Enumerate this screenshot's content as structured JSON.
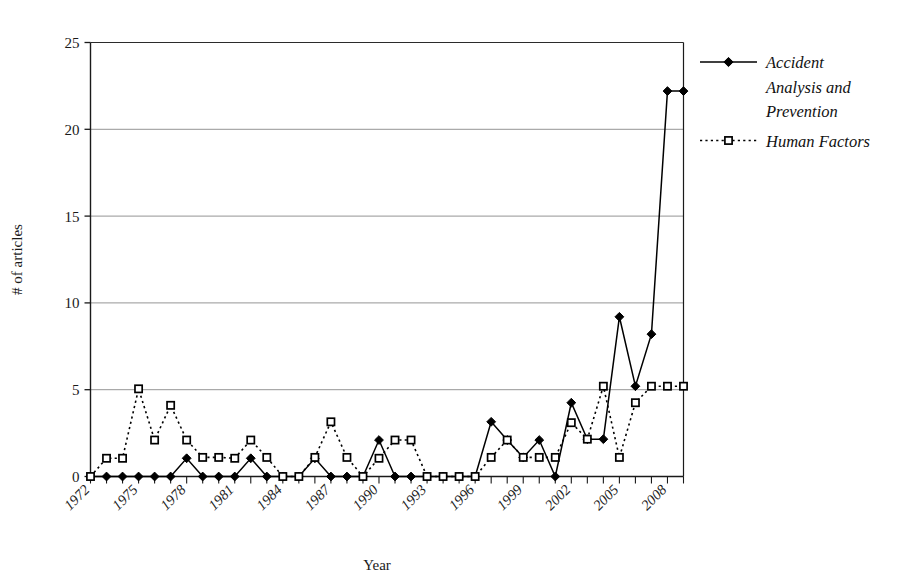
{
  "chart_data": {
    "type": "line",
    "title": "",
    "xlabel": "Year",
    "ylabel": "# of articles",
    "ylim": [
      0,
      25
    ],
    "yticks": [
      0,
      5,
      10,
      15,
      20,
      25
    ],
    "ytick_labels": [
      "0",
      "5",
      "10",
      "15",
      "20",
      "25"
    ],
    "grid": true,
    "grid_axis": "y",
    "legend_position": "right",
    "x": [
      1972,
      1973,
      1974,
      1975,
      1976,
      1977,
      1978,
      1979,
      1980,
      1981,
      1982,
      1983,
      1984,
      1985,
      1986,
      1987,
      1988,
      1989,
      1990,
      1991,
      1992,
      1993,
      1994,
      1995,
      1996,
      1997,
      1998,
      1999,
      2000,
      2001,
      2002,
      2003,
      2004,
      2005,
      2006,
      2007,
      2008,
      2009
    ],
    "xtick_labels": [
      "1972",
      "1975",
      "1978",
      "1981",
      "1984",
      "1987",
      "1990",
      "1993",
      "1996",
      "1999",
      "2002",
      "2005",
      "2008"
    ],
    "xtick_values": [
      1972,
      1975,
      1978,
      1981,
      1984,
      1987,
      1990,
      1993,
      1996,
      1999,
      2002,
      2005,
      2008
    ],
    "series": [
      {
        "name": "Accident Analysis and Prevention",
        "marker": "filled-diamond",
        "linestyle": "solid",
        "color": "#000000",
        "values": [
          0,
          0,
          0,
          0,
          0,
          0,
          1.05,
          0,
          0,
          0,
          1.05,
          0,
          0,
          0,
          1.05,
          0,
          0,
          0,
          2.1,
          0,
          0,
          0,
          0,
          0,
          0,
          3.15,
          2.1,
          1.1,
          2.1,
          0,
          4.25,
          2.15,
          2.15,
          9.2,
          5.2,
          8.2,
          22.2,
          22.2
        ]
      },
      {
        "name": "Human Factors",
        "marker": "open-square",
        "linestyle": "dotted",
        "color": "#000000",
        "values": [
          0,
          1.05,
          1.05,
          5.05,
          2.1,
          4.1,
          2.1,
          1.1,
          1.1,
          1.05,
          2.1,
          1.1,
          0,
          0,
          1.1,
          3.15,
          1.1,
          0,
          1.05,
          2.1,
          2.1,
          0,
          0,
          0,
          0,
          1.1,
          2.1,
          1.1,
          1.1,
          1.1,
          3.1,
          2.15,
          5.2,
          1.1,
          4.25,
          5.2,
          5.2,
          5.2
        ]
      }
    ]
  },
  "legend": {
    "entries": [
      {
        "label": "Accident Analysis and Prevention",
        "marker": "filled-diamond",
        "linestyle": "solid"
      },
      {
        "label": "Human Factors",
        "marker": "open-square",
        "linestyle": "dotted"
      }
    ]
  },
  "axes": {
    "y_title": "# of articles",
    "x_title": "Year"
  }
}
